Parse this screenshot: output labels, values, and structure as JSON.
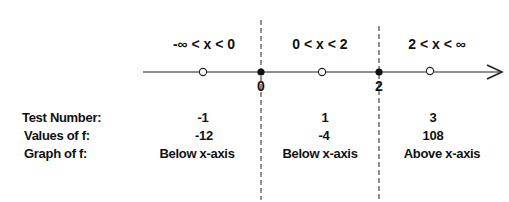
{
  "diagram": {
    "type": "sign-chart",
    "intervals": [
      {
        "label": "-∞ < x < 0",
        "test_number": "-1",
        "value": "-12",
        "graph": "Below x-axis"
      },
      {
        "label": "0 < x < 2",
        "test_number": "1",
        "value": "-4",
        "graph": "Below x-axis"
      },
      {
        "label": "2 < x < ∞",
        "test_number": "3",
        "value": "108",
        "graph": "Above x-axis"
      }
    ],
    "critical_points": [
      {
        "label": "0"
      },
      {
        "label": "2"
      }
    ],
    "row_labels": {
      "test_number": "Test Number:",
      "values": "Values of f:",
      "graph": "Graph of f:"
    }
  }
}
